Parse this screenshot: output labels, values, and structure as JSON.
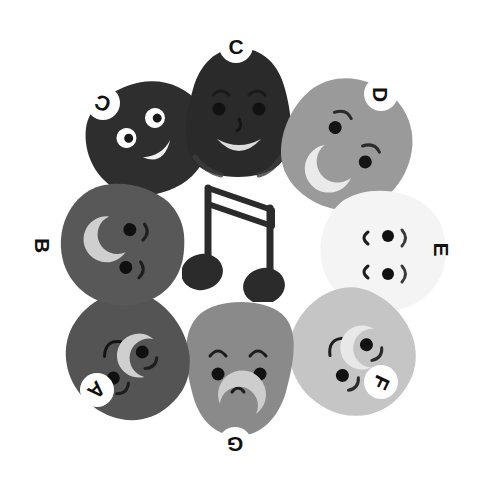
{
  "figure": {
    "background_color": "#ffffff",
    "width": 478,
    "height": 485,
    "center_icon": {
      "name": "beamed-eighth-notes",
      "color": "#2b2b2b",
      "description": "Pair of beamed eighth notes drawn as an outlined stem with beam and two filled note heads"
    },
    "label_style": {
      "circle_fill": "#ffffff",
      "text_color": "#111111",
      "font_size_px": 21
    },
    "characters": [
      {
        "id": "A",
        "label": "A",
        "color": "#545454",
        "label_rotation_deg": 135,
        "position": "lower-left",
        "cx": 124,
        "cy": 358,
        "label_x": 80,
        "label_y": 373,
        "face_rotation_deg": 130,
        "face": "two dot eyes, two eyebrow arcs, small smile, crescent highlight"
      },
      {
        "id": "B",
        "label": "B",
        "color": "#585858",
        "label_rotation_deg": 90,
        "position": "left",
        "cx": 118,
        "cy": 243,
        "label_x": 26,
        "label_y": 228,
        "face_rotation_deg": 90,
        "face": "two dot eyes, two eyebrow arcs, crescent smile highlight"
      },
      {
        "id": "C-upper-left",
        "label": "C",
        "color": "#2e2e2e",
        "label_rotation_deg": 200,
        "position": "upper-left",
        "cx": 140,
        "cy": 133,
        "label_x": 86,
        "label_y": 86,
        "face_rotation_deg": 205,
        "face": "two white-ringed eyes with dark pupils, wide white smile"
      },
      {
        "id": "C-top",
        "label": "C",
        "color": "#2a2a2a",
        "label_rotation_deg": 0,
        "position": "top",
        "cx": 235,
        "cy": 112,
        "label_x": 219,
        "label_y": 29,
        "face_rotation_deg": 0,
        "face": "two dot eyes, two eyebrow arcs, nose, wide light smile"
      },
      {
        "id": "D",
        "label": "D",
        "color": "#9a9a9a",
        "label_rotation_deg": 90,
        "position": "upper-right",
        "cx": 344,
        "cy": 146,
        "label_x": 364,
        "label_y": 77,
        "face_rotation_deg": 115,
        "face": "two dot eyes, two eyebrow arcs, crescent smile highlight"
      },
      {
        "id": "E",
        "label": "E",
        "color": "#f4f4f4",
        "label_rotation_deg": 90,
        "position": "right",
        "label_bare": true,
        "cx": 382,
        "cy": 250,
        "label_x": 424,
        "label_y": 232,
        "face_rotation_deg": 90,
        "face": "two dot eyes, small curved mouth arcs"
      },
      {
        "id": "F",
        "label": "F",
        "color": "#c5c5c5",
        "label_rotation_deg": 115,
        "position": "lower-right",
        "cx": 350,
        "cy": 355,
        "label_x": 364,
        "label_y": 365,
        "face_rotation_deg": 120,
        "face": "two dot eyes, two eyebrow arcs, small smile, crescent highlight"
      },
      {
        "id": "G",
        "label": "G",
        "color": "#8a8a8a",
        "label_rotation_deg": 180,
        "position": "bottom",
        "cx": 238,
        "cy": 368,
        "label_x": 218,
        "label_y": 427,
        "face_rotation_deg": 180,
        "face": "two dot eyes, two smile arcs, nose, crescent highlight"
      }
    ]
  }
}
